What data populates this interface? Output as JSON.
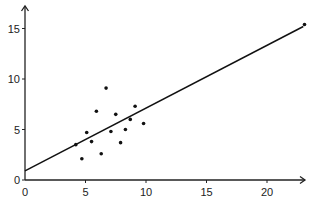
{
  "chart_data": {
    "type": "scatter",
    "title": "",
    "xlabel": "",
    "ylabel": "",
    "xlim": [
      0,
      23.5
    ],
    "ylim": [
      0,
      17
    ],
    "xticks": [
      0,
      5,
      10,
      15,
      20
    ],
    "yticks": [
      0,
      5,
      10,
      15
    ],
    "grid": false,
    "legend": null,
    "series": [
      {
        "name": "points",
        "points": [
          [
            4.2,
            3.5
          ],
          [
            4.7,
            2.1
          ],
          [
            5.1,
            4.7
          ],
          [
            5.5,
            3.8
          ],
          [
            5.9,
            6.8
          ],
          [
            6.3,
            2.6
          ],
          [
            6.7,
            9.1
          ],
          [
            7.1,
            4.8
          ],
          [
            7.5,
            6.5
          ],
          [
            7.9,
            3.7
          ],
          [
            8.3,
            5.0
          ],
          [
            8.7,
            6.0
          ],
          [
            9.1,
            7.3
          ],
          [
            9.8,
            5.6
          ],
          [
            23.1,
            15.4
          ]
        ]
      }
    ],
    "regression_line": {
      "x": [
        0,
        23
      ],
      "y": [
        0.9,
        15.2
      ]
    },
    "annotations": []
  },
  "layout": {
    "origin_px": [
      25,
      180
    ],
    "px_per_x": 12.1,
    "px_per_y": 10.1,
    "x_axis_end_px": 305,
    "y_axis_end_px": 6
  },
  "colors": {
    "axis": "#222222",
    "point": "#111111",
    "line": "#111111"
  }
}
